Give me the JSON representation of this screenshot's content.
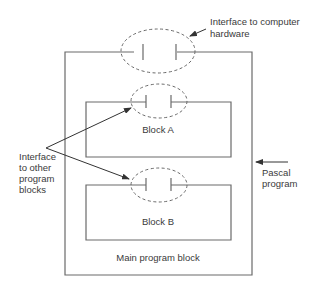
{
  "diagram": {
    "type": "block-structure",
    "labels": {
      "hardware_interface": [
        "Interface to computer",
        "hardware"
      ],
      "block_a": "Block A",
      "block_b": "Block B",
      "main_block": "Main program block",
      "other_interface": [
        "Interface",
        "to other",
        "program",
        "blocks"
      ],
      "pascal_program": [
        "Pascal",
        "program"
      ]
    },
    "colors": {
      "line": "#6a6a6a",
      "text": "#3a3a3a",
      "background": "#ffffff"
    }
  }
}
